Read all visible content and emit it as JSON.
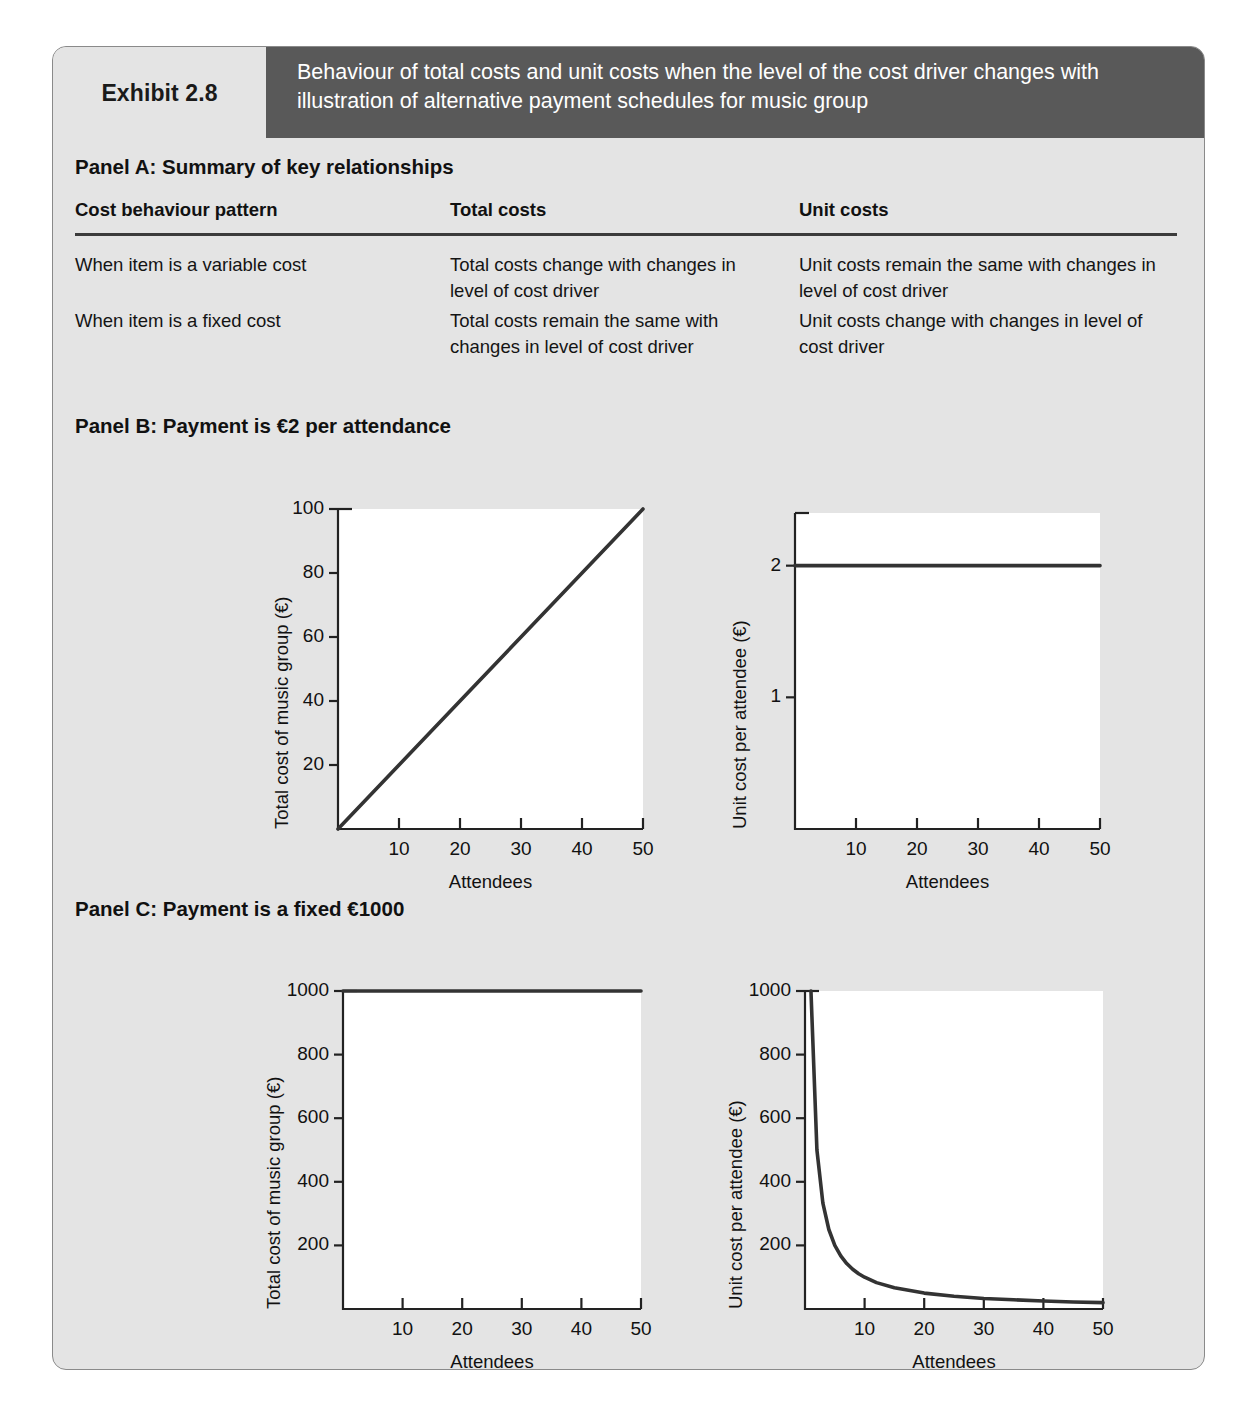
{
  "exhibit": {
    "tab_label": "Exhibit 2.8",
    "title": "Behaviour of total costs and unit costs when the level of the cost driver changes with illustration of alternative payment schedules for music group",
    "header_bg": "#595959",
    "card_bg": "#e4e4e4",
    "line_color": "#333333"
  },
  "panel_a": {
    "heading": "Panel A: Summary of key relationships",
    "columns": [
      "Cost behaviour pattern",
      "Total costs",
      "Unit costs"
    ],
    "rows": [
      [
        "When item is a variable cost",
        "Total costs change with changes in level of cost driver",
        "Unit costs remain the same with changes in level of cost driver"
      ],
      [
        "When item is a fixed cost",
        "Total costs remain the same with changes in level of cost driver",
        "Unit costs change with changes in level of cost driver"
      ]
    ]
  },
  "panel_b": {
    "heading": "Panel B: Payment is €2 per attendance"
  },
  "panel_c": {
    "heading": "Panel C: Payment is a fixed €1000"
  },
  "chart_data": [
    {
      "id": "b-total",
      "type": "line",
      "panel": "Panel B",
      "title": "",
      "xlabel": "Attendees",
      "ylabel": "Total cost of music group (€)",
      "xlim": [
        0,
        50
      ],
      "ylim": [
        0,
        100
      ],
      "xticks": [
        10,
        20,
        30,
        40,
        50
      ],
      "yticks": [
        20,
        40,
        60,
        80,
        100
      ],
      "grid": false,
      "series": [
        {
          "name": "Total cost = €2 × attendees",
          "x": [
            0,
            10,
            20,
            30,
            40,
            50
          ],
          "values": [
            0,
            20,
            40,
            60,
            80,
            100
          ]
        }
      ]
    },
    {
      "id": "b-unit",
      "type": "line",
      "panel": "Panel B",
      "title": "",
      "xlabel": "Attendees",
      "ylabel": "Unit cost per attendee (€)",
      "xlim": [
        0,
        50
      ],
      "ylim": [
        0,
        2.4
      ],
      "xticks": [
        10,
        20,
        30,
        40,
        50
      ],
      "yticks": [
        1,
        2
      ],
      "grid": false,
      "series": [
        {
          "name": "Unit cost = €2",
          "x": [
            0,
            10,
            20,
            30,
            40,
            50
          ],
          "values": [
            2,
            2,
            2,
            2,
            2,
            2
          ]
        }
      ]
    },
    {
      "id": "c-total",
      "type": "line",
      "panel": "Panel C",
      "title": "",
      "xlabel": "Attendees",
      "ylabel": "Total cost of music group (€)",
      "xlim": [
        0,
        50
      ],
      "ylim": [
        0,
        1000
      ],
      "xticks": [
        10,
        20,
        30,
        40,
        50
      ],
      "yticks": [
        200,
        400,
        600,
        800,
        1000
      ],
      "grid": false,
      "series": [
        {
          "name": "Total cost = €1000 fixed",
          "x": [
            0,
            10,
            20,
            30,
            40,
            50
          ],
          "values": [
            1000,
            1000,
            1000,
            1000,
            1000,
            1000
          ]
        }
      ]
    },
    {
      "id": "c-unit",
      "type": "line",
      "panel": "Panel C",
      "title": "",
      "xlabel": "Attendees",
      "ylabel": "Unit cost per attendee (€)",
      "xlim": [
        0,
        50
      ],
      "ylim": [
        0,
        1000
      ],
      "xticks": [
        10,
        20,
        30,
        40,
        50
      ],
      "yticks": [
        200,
        400,
        600,
        800,
        1000
      ],
      "grid": false,
      "series": [
        {
          "name": "Unit cost = €1000 / attendees",
          "x": [
            1,
            2,
            3,
            4,
            5,
            6,
            7,
            8,
            9,
            10,
            12,
            15,
            20,
            25,
            30,
            35,
            40,
            45,
            50
          ],
          "values": [
            1000,
            500,
            333,
            250,
            200,
            167,
            143,
            125,
            111,
            100,
            83,
            67,
            50,
            40,
            33,
            29,
            25,
            22,
            20
          ]
        }
      ]
    }
  ]
}
